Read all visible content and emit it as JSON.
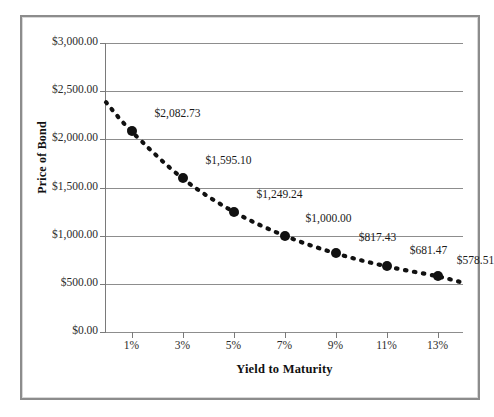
{
  "chart_data": {
    "type": "line",
    "title": "",
    "xlabel": "Yield to Maturity",
    "ylabel": "Price of Bond",
    "x": [
      1,
      3,
      5,
      7,
      9,
      11,
      13
    ],
    "xtick_labels": [
      "1%",
      "3%",
      "5%",
      "7%",
      "9%",
      "11%",
      "13%"
    ],
    "values": [
      2082.73,
      1595.1,
      1249.24,
      1000.0,
      817.43,
      681.47,
      578.51
    ],
    "point_labels": [
      "$2,082.73",
      "$1,595.10",
      "$1,249.24",
      "$1,000.00",
      "$817.43",
      "$681.47",
      "$578.51"
    ],
    "ytick_labels": [
      "$3,000.00",
      "$2,500.00",
      "$2,000.00",
      "$1,500.00",
      "$1,000.00",
      "$500.00",
      "$0.00"
    ],
    "ytick_values": [
      3000,
      2500,
      2000,
      1500,
      1000,
      500,
      0
    ],
    "ylim": [
      0,
      3000
    ],
    "xlim": [
      0,
      14
    ],
    "grid": "horizontal",
    "legend": "none",
    "series_style": "dotted",
    "marker": "filled-circle",
    "colors": {
      "line": "#111111",
      "marker": "#111111",
      "gridline": "#8d8d8d",
      "axis": "#7a7a7a",
      "frame": "#8c8c8c",
      "background": "#ffffff",
      "text": "#1a1a1a"
    }
  }
}
